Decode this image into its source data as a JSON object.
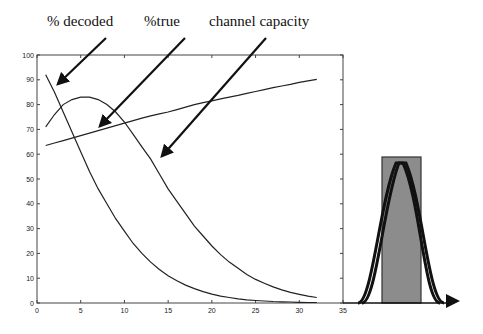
{
  "annotations": {
    "decoded": "% decoded",
    "true": "%true",
    "capacity": "channel capacity"
  },
  "colors": {
    "line": "#222222",
    "inset_fill": "#8c8c8c",
    "background": "#ffffff"
  },
  "chart_data": [
    {
      "type": "line",
      "title": "",
      "xlabel": "",
      "ylabel": "",
      "xlim": [
        0,
        35
      ],
      "ylim": [
        0,
        100
      ],
      "x_ticks": [
        0,
        5,
        10,
        15,
        20,
        25,
        30,
        35
      ],
      "y_ticks": [
        0,
        10,
        20,
        30,
        40,
        50,
        60,
        70,
        80,
        90,
        100
      ],
      "grid": false,
      "legend": "none (arrow annotations above plot)",
      "x": [
        1,
        2,
        3,
        4,
        5,
        6,
        7,
        8,
        9,
        10,
        11,
        12,
        13,
        14,
        15,
        16,
        17,
        18,
        19,
        20,
        21,
        22,
        23,
        24,
        25,
        26,
        27,
        28,
        29,
        30,
        31,
        32
      ],
      "series": [
        {
          "name": "% decoded",
          "values": [
            92,
            85,
            77,
            69,
            61,
            53,
            46,
            40,
            34,
            29,
            24,
            20,
            16.5,
            13.5,
            11,
            9,
            7.2,
            5.8,
            4.6,
            3.6,
            2.8,
            2.2,
            1.7,
            1.3,
            1.0,
            0.8,
            0.6,
            0.5,
            0.4,
            0.3,
            0.2,
            0.2
          ]
        },
        {
          "name": "%true",
          "values": [
            71,
            76,
            80,
            82,
            83,
            83,
            82,
            80,
            77,
            73,
            68,
            63,
            58,
            52,
            46,
            41,
            36,
            31,
            27,
            23,
            19.5,
            16.5,
            14,
            11.5,
            9.5,
            8,
            6.5,
            5.3,
            4.3,
            3.5,
            2.8,
            2.2
          ]
        },
        {
          "name": "channel capacity",
          "values": [
            63.5,
            64.5,
            65.5,
            66.5,
            67.5,
            68.5,
            69.5,
            70.5,
            71.5,
            72.5,
            73.5,
            74.5,
            75.5,
            76.3,
            77,
            78,
            79,
            80,
            80.8,
            81.5,
            82.3,
            83,
            83.7,
            84.5,
            85.3,
            86,
            86.8,
            87.5,
            88.2,
            89,
            89.6,
            90.2
          ]
        }
      ]
    },
    {
      "type": "diagram",
      "description": "Inset: gray rectangle overlaid with two nearly-identical bell curves on an arrowed baseline",
      "elements": [
        "gray rectangle",
        "bell curve 1",
        "bell curve 2",
        "baseline arrow"
      ]
    }
  ]
}
